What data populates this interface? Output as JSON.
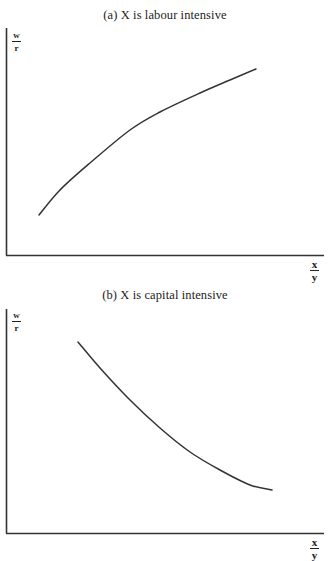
{
  "chart_data": [
    {
      "type": "line",
      "title": "(a)  X is labour intensive",
      "xlabel": {
        "numerator": "x",
        "denominator": "y"
      },
      "ylabel": {
        "numerator": "w",
        "denominator": "r"
      },
      "grid": false,
      "legend": null,
      "ticks": {
        "x": [],
        "y": []
      },
      "series": [
        {
          "name": "w/r vs x/y",
          "shape": "increasing, concave",
          "points_px": [
            [
              39,
              215
            ],
            [
              60,
              190
            ],
            [
              90,
              163
            ],
            [
              130,
              130
            ],
            [
              160,
              112
            ],
            [
              200,
              93
            ],
            [
              230,
              80
            ],
            [
              256,
              69
            ]
          ]
        }
      ],
      "axis_px": {
        "origin": [
          6,
          255
        ],
        "y_top": 28,
        "x_right": 324
      },
      "color": "#333333"
    },
    {
      "type": "line",
      "title": "(b)  X is capital intensive",
      "xlabel": {
        "numerator": "x",
        "denominator": "y"
      },
      "ylabel": {
        "numerator": "w",
        "denominator": "r"
      },
      "grid": false,
      "legend": null,
      "ticks": {
        "x": [],
        "y": []
      },
      "series": [
        {
          "name": "w/r vs x/y",
          "shape": "decreasing, convex",
          "points_px": [
            [
              78,
              342
            ],
            [
              100,
              368
            ],
            [
              130,
              400
            ],
            [
              160,
              428
            ],
            [
              190,
              452
            ],
            [
              220,
              470
            ],
            [
              250,
              485
            ],
            [
              272,
              490
            ]
          ]
        }
      ],
      "axis_px": {
        "origin": [
          6,
          533
        ],
        "y_top": 309,
        "x_right": 324
      },
      "color": "#333333"
    }
  ],
  "panel_a": {
    "title": "(a)  X is labour intensive",
    "ylabel_num": "w",
    "ylabel_den": "r",
    "xlabel_num": "x",
    "xlabel_den": "y"
  },
  "panel_b": {
    "title": "(b)  X is capital intensive",
    "ylabel_num": "w",
    "ylabel_den": "r",
    "xlabel_num": "x",
    "xlabel_den": "y"
  },
  "style": {
    "axis_color": "#333333",
    "curve_color": "#333333"
  }
}
